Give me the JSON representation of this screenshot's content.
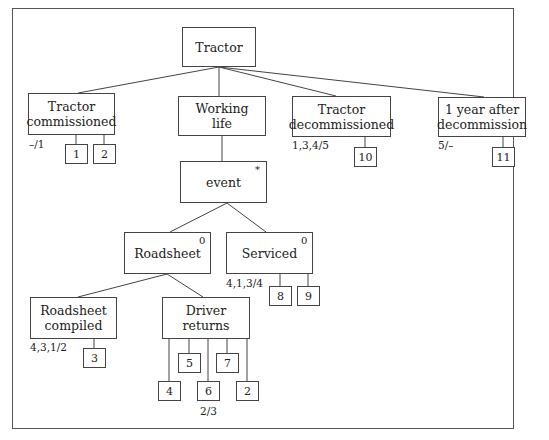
{
  "diagram": {
    "type": "tree",
    "root": {
      "id": "tractor",
      "label": "Tractor",
      "x": 182,
      "y": 27,
      "w": 74,
      "h": 40
    },
    "nodes": [
      {
        "id": "commissioned",
        "label": "Tractor\ncommissioned",
        "x": 28,
        "y": 93,
        "w": 87,
        "h": 42,
        "annotation": "–/1",
        "ann_x": 29,
        "ann_y": 138
      },
      {
        "id": "working-life",
        "label": "Working\nlife",
        "x": 178,
        "y": 96,
        "w": 88,
        "h": 40
      },
      {
        "id": "decommissioned",
        "label": "Tractor\ndecommissioned",
        "x": 292,
        "y": 96,
        "w": 99,
        "h": 41,
        "annotation": "1,3,4/5",
        "ann_x": 292,
        "ann_y": 139
      },
      {
        "id": "after-decommission",
        "label": "1 year after\ndecommission",
        "x": 438,
        "y": 97,
        "w": 88,
        "h": 40,
        "annotation": "5/–",
        "ann_x": 438,
        "ann_y": 139
      },
      {
        "id": "event",
        "label": "event",
        "x": 180,
        "y": 161,
        "w": 87,
        "h": 42,
        "marker": "*"
      },
      {
        "id": "roadsheet",
        "label": "Roadsheet",
        "x": 124,
        "y": 232,
        "w": 87,
        "h": 42,
        "marker": "0"
      },
      {
        "id": "serviced",
        "label": "Serviced",
        "x": 226,
        "y": 232,
        "w": 87,
        "h": 42,
        "marker": "0",
        "annotation": "4,1,3/4",
        "ann_x": 226,
        "ann_y": 277
      },
      {
        "id": "roadsheet-compiled",
        "label": "Roadsheet\ncompiled",
        "x": 30,
        "y": 297,
        "w": 87,
        "h": 42,
        "annotation": "4,3,1/2",
        "ann_x": 30,
        "ann_y": 341
      },
      {
        "id": "driver-returns",
        "label": "Driver\nreturns",
        "x": 162,
        "y": 297,
        "w": 88,
        "h": 42
      }
    ],
    "leaves": [
      {
        "id": "leaf-1",
        "label": "1",
        "x": 65,
        "y": 144,
        "w": 23,
        "h": 20,
        "parent_x": 76
      },
      {
        "id": "leaf-2a",
        "label": "2",
        "x": 93,
        "y": 144,
        "w": 23,
        "h": 20,
        "parent_x": 104
      },
      {
        "id": "leaf-10",
        "label": "10",
        "x": 354,
        "y": 147,
        "w": 23,
        "h": 20,
        "parent_x": 365
      },
      {
        "id": "leaf-11",
        "label": "11",
        "x": 492,
        "y": 147,
        "w": 23,
        "h": 20,
        "parent_x": 503
      },
      {
        "id": "leaf-8",
        "label": "8",
        "x": 269,
        "y": 286,
        "w": 23,
        "h": 20,
        "parent_x": 280
      },
      {
        "id": "leaf-9",
        "label": "9",
        "x": 297,
        "y": 286,
        "w": 23,
        "h": 20,
        "parent_x": 308
      },
      {
        "id": "leaf-3",
        "label": "3",
        "x": 83,
        "y": 348,
        "w": 23,
        "h": 20,
        "parent_x": 94
      },
      {
        "id": "leaf-5",
        "label": "5",
        "x": 178,
        "y": 353,
        "w": 23,
        "h": 20,
        "parent_x": 189
      },
      {
        "id": "leaf-7",
        "label": "7",
        "x": 216,
        "y": 353,
        "w": 23,
        "h": 20,
        "parent_x": 227
      },
      {
        "id": "leaf-4",
        "label": "4",
        "x": 158,
        "y": 381,
        "w": 23,
        "h": 20,
        "parent_x": 169
      },
      {
        "id": "leaf-6",
        "label": "6",
        "x": 197,
        "y": 381,
        "w": 23,
        "h": 20,
        "parent_x": 208,
        "annotation": "2/3",
        "ann_x": 200,
        "ann_y": 405
      },
      {
        "id": "leaf-2b",
        "label": "2",
        "x": 236,
        "y": 381,
        "w": 23,
        "h": 20,
        "parent_x": 247
      }
    ],
    "edges": [
      {
        "from": "tractor",
        "to": "commissioned",
        "x1": 219,
        "y1": 67,
        "x2": 78,
        "y2": 93
      },
      {
        "from": "tractor",
        "to": "working-life",
        "x1": 219,
        "y1": 67,
        "x2": 219,
        "y2": 96
      },
      {
        "from": "tractor",
        "to": "decommissioned",
        "x1": 219,
        "y1": 67,
        "x2": 336,
        "y2": 96
      },
      {
        "from": "tractor",
        "to": "after-decommission",
        "x1": 219,
        "y1": 67,
        "x2": 484,
        "y2": 97
      },
      {
        "from": "working-life",
        "to": "event",
        "x1": 222,
        "y1": 136,
        "x2": 222,
        "y2": 161
      },
      {
        "from": "event",
        "to": "roadsheet",
        "x1": 227,
        "y1": 203,
        "x2": 170,
        "y2": 232
      },
      {
        "from": "event",
        "to": "serviced",
        "x1": 227,
        "y1": 203,
        "x2": 266,
        "y2": 232
      },
      {
        "from": "roadsheet",
        "to": "roadsheet-compiled",
        "x1": 167,
        "y1": 274,
        "x2": 78,
        "y2": 297
      },
      {
        "from": "roadsheet",
        "to": "driver-returns",
        "x1": 167,
        "y1": 274,
        "x2": 203,
        "y2": 297
      }
    ]
  }
}
